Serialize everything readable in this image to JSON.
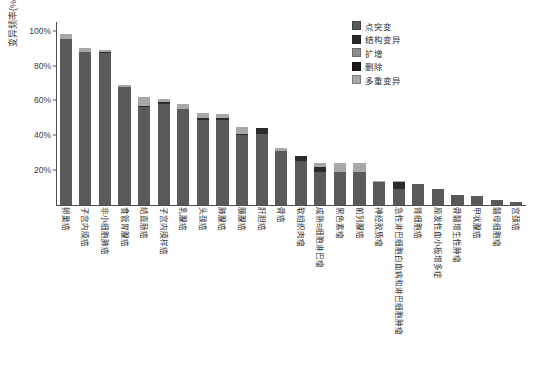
{
  "chart_data": {
    "type": "bar",
    "title": "",
    "subtitle": "",
    "xlabel": "",
    "ylabel": "变异频率(%)",
    "ylim": [
      0,
      105
    ],
    "grid": false,
    "stacked": true,
    "legend_position": "top-right",
    "ytick_labels": [
      "20%",
      "40%",
      "60%",
      "80%",
      "100%"
    ],
    "ytick_values": [
      20,
      40,
      60,
      80,
      100
    ],
    "categories": [
      "卵巢癌",
      "子宫内膜癌",
      "非小细胞肺癌",
      "食管胃腺癌",
      "结直肠癌",
      "子宫内膜样癌",
      "乳腺癌",
      "头颈癌",
      "肺腺癌",
      "胰腺癌",
      "肝胆癌",
      "骨癌",
      "软组织肉瘤",
      "成熟B细胞淋巴瘤",
      "黑色素瘤",
      "前列腺癌",
      "神经胶质瘤",
      "急性淋巴细胞白血病和淋巴细胞肿瘤",
      "肾细胞癌",
      "原发性血小板增多症",
      "骨髓增生性肿瘤",
      "甲状腺癌",
      "髓母细胞瘤",
      "宫颈癌"
    ],
    "series": [
      {
        "name": "点突变",
        "color": "#5a5a5a",
        "values": [
          95,
          88,
          87,
          68,
          56,
          58,
          55,
          49,
          49,
          40,
          41,
          31,
          25,
          19,
          19,
          19,
          13,
          9,
          12,
          9,
          6,
          5,
          3,
          2
        ]
      },
      {
        "name": "结构变异",
        "color": "#2b2b2b",
        "values": [
          0,
          0,
          1,
          0,
          1,
          1,
          0,
          1,
          1,
          1,
          3,
          0,
          3,
          3,
          0,
          0,
          0,
          4,
          0,
          0,
          0,
          0,
          0,
          0
        ]
      },
      {
        "name": "扩增",
        "color": "#8c8c8c",
        "values": [
          0,
          0,
          0,
          0,
          0,
          0,
          0,
          0,
          0,
          0,
          0,
          0,
          0,
          0,
          0,
          0,
          0,
          0,
          0,
          0,
          0,
          0,
          0,
          0
        ]
      },
      {
        "name": "删除",
        "color": "#1a1a1a",
        "values": [
          0,
          0,
          0,
          0,
          0,
          0,
          0,
          0,
          0,
          0,
          0,
          0,
          0,
          0,
          0,
          0,
          0,
          0,
          0,
          0,
          0,
          0,
          0,
          0
        ]
      },
      {
        "name": "多重变异",
        "color": "#a8a8a8",
        "values": [
          3,
          2,
          1,
          1,
          5,
          2,
          3,
          3,
          2,
          4,
          0,
          2,
          0,
          2,
          5,
          5,
          1,
          1,
          0,
          0,
          0,
          0,
          0,
          0
        ]
      }
    ],
    "totals": [
      98,
      90,
      89,
      69,
      62,
      61,
      58,
      53,
      52,
      45,
      44,
      33,
      28,
      24,
      24,
      24,
      14,
      14,
      12,
      9,
      6,
      5,
      3,
      2
    ]
  }
}
